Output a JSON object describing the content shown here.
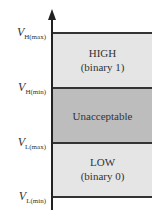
{
  "diagram": {
    "y_axis": {
      "direction": "up"
    },
    "levels": [
      {
        "symbol": "V",
        "subscript": "H(max)"
      },
      {
        "symbol": "V",
        "subscript": "H(min)"
      },
      {
        "symbol": "V",
        "subscript": "L(max)"
      },
      {
        "symbol": "V",
        "subscript": "L(min)"
      }
    ],
    "bands": [
      {
        "name": "HIGH",
        "detail": "(binary 1)",
        "color": "#e5e5e5"
      },
      {
        "name": "Unacceptable",
        "detail": "",
        "color": "#bdbdbd"
      },
      {
        "name": "LOW",
        "detail": "(binary 0)",
        "color": "#e5e5e5"
      }
    ]
  }
}
